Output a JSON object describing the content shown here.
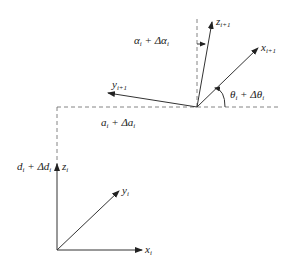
{
  "diagram": {
    "type": "coordinate-frame-transformation",
    "frame_i": {
      "origin_label": "",
      "axes": [
        {
          "name": "x",
          "sub": "i"
        },
        {
          "name": "y",
          "sub": "i"
        },
        {
          "name": "z",
          "sub": "i"
        }
      ]
    },
    "frame_i1": {
      "axes": [
        {
          "name": "x",
          "sub": "i+1"
        },
        {
          "name": "y",
          "sub": "i+1"
        },
        {
          "name": "z",
          "sub": "i+1"
        }
      ]
    },
    "labels": {
      "alpha": {
        "main": "α",
        "sub": "i",
        "plus": " + Δα",
        "sub2": "i"
      },
      "a": {
        "main": "a",
        "sub": "i",
        "plus": " + Δa",
        "sub2": "i"
      },
      "d": {
        "main": "d",
        "sub": "i",
        "plus": " + Δd",
        "sub2": "i"
      },
      "theta": {
        "main": "θ",
        "sub": "i",
        "plus": " + Δθ",
        "sub2": "i"
      }
    }
  }
}
